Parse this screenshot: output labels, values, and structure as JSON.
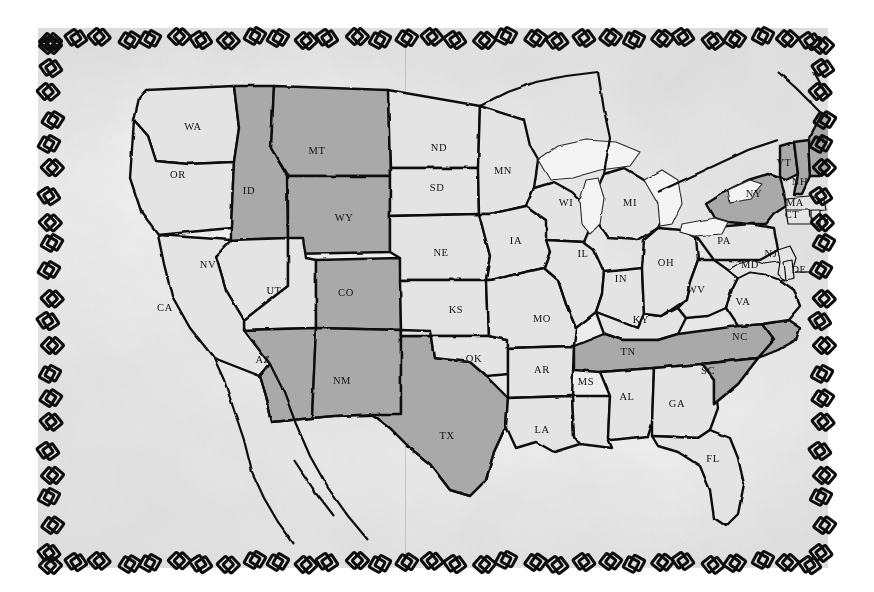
{
  "document": {
    "kind": "hand-drawn pencil map",
    "title": "Map of the contiguous United States",
    "border_ornament": "chain-link-border",
    "background_color": "#e9e9e8",
    "ink_color": "#0e0e0e",
    "plain_fill": "#e4e4e3",
    "shaded_fill": "#a9a9a8"
  },
  "legend": {
    "shaded_meaning": "shaded states",
    "plain_meaning": "unshaded states"
  },
  "states": [
    {
      "code": "WA",
      "x": 155,
      "y": 100,
      "shaded": false
    },
    {
      "code": "OR",
      "x": 140,
      "y": 148,
      "shaded": false
    },
    {
      "code": "ID",
      "x": 211,
      "y": 164,
      "shaded": true
    },
    {
      "code": "MT",
      "x": 279,
      "y": 124,
      "shaded": true
    },
    {
      "code": "WY",
      "x": 306,
      "y": 191,
      "shaded": true
    },
    {
      "code": "NV",
      "x": 170,
      "y": 238,
      "shaded": false
    },
    {
      "code": "UT",
      "x": 236,
      "y": 264,
      "shaded": false
    },
    {
      "code": "CA",
      "x": 127,
      "y": 281,
      "shaded": false
    },
    {
      "code": "AZ",
      "x": 225,
      "y": 333,
      "shaded": true
    },
    {
      "code": "CO",
      "x": 308,
      "y": 266,
      "shaded": true
    },
    {
      "code": "NM",
      "x": 304,
      "y": 354,
      "shaded": true
    },
    {
      "code": "TX",
      "x": 409,
      "y": 409,
      "shaded": true
    },
    {
      "code": "ND",
      "x": 401,
      "y": 121,
      "shaded": false
    },
    {
      "code": "SD",
      "x": 399,
      "y": 161,
      "shaded": false
    },
    {
      "code": "NE",
      "x": 403,
      "y": 226,
      "shaded": false
    },
    {
      "code": "KS",
      "x": 418,
      "y": 283,
      "shaded": false
    },
    {
      "code": "OK",
      "x": 436,
      "y": 332,
      "shaded": false
    },
    {
      "code": "MN",
      "x": 465,
      "y": 144,
      "shaded": false
    },
    {
      "code": "IA",
      "x": 478,
      "y": 214,
      "shaded": false
    },
    {
      "code": "MO",
      "x": 504,
      "y": 292,
      "shaded": false
    },
    {
      "code": "AR",
      "x": 504,
      "y": 343,
      "shaded": false
    },
    {
      "code": "LA",
      "x": 504,
      "y": 403,
      "shaded": false
    },
    {
      "code": "WI",
      "x": 528,
      "y": 176,
      "shaded": false
    },
    {
      "code": "IL",
      "x": 545,
      "y": 227,
      "shaded": false
    },
    {
      "code": "MS",
      "x": 548,
      "y": 355,
      "shaded": false
    },
    {
      "code": "MI",
      "x": 592,
      "y": 176,
      "shaded": false
    },
    {
      "code": "IN",
      "x": 583,
      "y": 252,
      "shaded": false
    },
    {
      "code": "KY",
      "x": 603,
      "y": 293,
      "shaded": false
    },
    {
      "code": "TN",
      "x": 590,
      "y": 325,
      "shaded": true
    },
    {
      "code": "AL",
      "x": 589,
      "y": 370,
      "shaded": false
    },
    {
      "code": "OH",
      "x": 628,
      "y": 236,
      "shaded": false
    },
    {
      "code": "WV",
      "x": 658,
      "y": 263,
      "shaded": false
    },
    {
      "code": "GA",
      "x": 639,
      "y": 377,
      "shaded": false
    },
    {
      "code": "SC",
      "x": 670,
      "y": 344,
      "shaded": false
    },
    {
      "code": "FL",
      "x": 675,
      "y": 432,
      "shaded": false
    },
    {
      "code": "NC",
      "x": 702,
      "y": 310,
      "shaded": true
    },
    {
      "code": "VA",
      "x": 705,
      "y": 275,
      "shaded": false
    },
    {
      "code": "PA",
      "x": 686,
      "y": 214,
      "shaded": false
    },
    {
      "code": "MD",
      "x": 712,
      "y": 238,
      "shaded": false
    },
    {
      "code": "DE",
      "x": 761,
      "y": 243,
      "shaded": false
    },
    {
      "code": "NJ",
      "x": 733,
      "y": 227,
      "shaded": false
    },
    {
      "code": "NY",
      "x": 716,
      "y": 167,
      "shaded": true
    },
    {
      "code": "VT",
      "x": 746,
      "y": 136,
      "shaded": true
    },
    {
      "code": "NH",
      "x": 762,
      "y": 155,
      "shaded": true
    },
    {
      "code": "ME",
      "x": 786,
      "y": 113,
      "shaded": true
    },
    {
      "code": "MA",
      "x": 757,
      "y": 176,
      "shaded": false
    },
    {
      "code": "CT",
      "x": 754,
      "y": 188,
      "shaded": false
    },
    {
      "code": "RI",
      "x": 791,
      "y": 193,
      "shaded": false
    }
  ],
  "shaded_states": [
    "ID",
    "MT",
    "WY",
    "CO",
    "AZ",
    "NM",
    "TX",
    "TN",
    "NC",
    "NY",
    "VT",
    "NH",
    "ME"
  ],
  "waters": [
    "Lake Superior",
    "Lake Michigan",
    "Lake Huron",
    "Lake Erie",
    "Lake Ontario"
  ]
}
